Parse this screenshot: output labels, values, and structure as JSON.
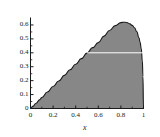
{
  "chart_data": {
    "type": "area",
    "title": "",
    "xlabel": "x",
    "ylabel": "",
    "xlim": [
      0,
      1
    ],
    "ylim": [
      0,
      0.65
    ],
    "grid": false,
    "legend": null,
    "fill_color": "#878787",
    "line_color": "#1a1a1a",
    "axis_color": "#1a1a1a",
    "reference_line_color": "#ffffff",
    "xticks": [
      0,
      0.2,
      0.4,
      0.6,
      0.8,
      1
    ],
    "xtick_labels": [
      "0",
      "0.2",
      "0.4",
      "0.6",
      "0.8",
      "1"
    ],
    "yticks": [
      0,
      0.1,
      0.2,
      0.3,
      0.4,
      0.5,
      0.6
    ],
    "ytick_labels": [
      "0",
      "0.1",
      "0.2",
      "0.3",
      "0.4",
      "0.5",
      "0.6"
    ],
    "x_minor_ticks": [
      0.1,
      0.3,
      0.5,
      0.7,
      0.9
    ],
    "y_minor_ticks": [
      0.05,
      0.15,
      0.25,
      0.35,
      0.45,
      0.55
    ],
    "reference_line": {
      "orientation": "horizontal",
      "y": 0.4,
      "x_start": 0.5,
      "x_end": 1.0
    },
    "x": [
      0,
      0.02,
      0.05,
      0.08,
      0.1,
      0.15,
      0.2,
      0.25,
      0.3,
      0.35,
      0.4,
      0.45,
      0.5,
      0.55,
      0.6,
      0.65,
      0.7,
      0.75,
      0.8,
      0.82,
      0.85,
      0.88,
      0.9,
      0.92,
      0.94,
      0.96,
      0.97,
      0.98,
      0.99,
      0.995,
      1
    ],
    "values": [
      0,
      0.015,
      0.038,
      0.062,
      0.078,
      0.118,
      0.158,
      0.198,
      0.238,
      0.278,
      0.318,
      0.358,
      0.398,
      0.437,
      0.473,
      0.52,
      0.56,
      0.595,
      0.617,
      0.62,
      0.618,
      0.608,
      0.597,
      0.58,
      0.553,
      0.508,
      0.475,
      0.43,
      0.34,
      0.23,
      0
    ]
  },
  "labels": {
    "x_axis_title": "x"
  }
}
